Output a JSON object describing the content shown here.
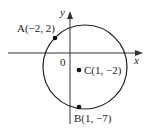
{
  "diagram": {
    "axes": {
      "x_label": "x",
      "y_label": "y",
      "origin_label": "0"
    },
    "circle": {
      "center": [
        1,
        -2
      ],
      "through": [
        [
          -2,
          2
        ],
        [
          1,
          -7
        ]
      ],
      "radius": 5
    },
    "points": [
      {
        "id": "A",
        "label": "A(−2, 2)",
        "x": -2,
        "y": 2
      },
      {
        "id": "C",
        "label": "C(1, −2)",
        "x": 1,
        "y": -2
      },
      {
        "id": "B",
        "label": "B(1, −7)",
        "x": 1,
        "y": -7
      }
    ]
  }
}
